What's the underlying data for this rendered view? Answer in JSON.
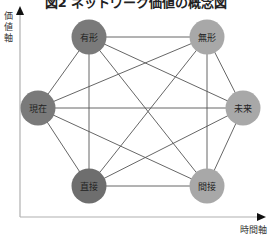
{
  "title": "図2 ネットワーク価値の概念図",
  "axes": {
    "y_label": [
      "価",
      "値",
      "軸"
    ],
    "x_label": "時間軸"
  },
  "nodes": [
    {
      "id": "tangible",
      "label": "有形",
      "cx": 89,
      "cy": 37,
      "color": "#7a7a7a"
    },
    {
      "id": "intangible",
      "label": "無形",
      "cx": 207,
      "cy": 37,
      "color": "#a8a8a8"
    },
    {
      "id": "present",
      "label": "現在",
      "cx": 38,
      "cy": 108,
      "color": "#7a7a7a"
    },
    {
      "id": "future",
      "label": "未来",
      "cx": 243,
      "cy": 108,
      "color": "#a8a8a8"
    },
    {
      "id": "direct",
      "label": "直接",
      "cx": 89,
      "cy": 186,
      "color": "#6e6e6e"
    },
    {
      "id": "indirect",
      "label": "間接",
      "cx": 207,
      "cy": 186,
      "color": "#a8a8a8"
    }
  ],
  "edges": "complete-graph",
  "colors": {
    "dark_node": "#7a7a7a",
    "light_node": "#a8a8a8",
    "edge": "#555555",
    "axis": "#aaaaaa"
  }
}
